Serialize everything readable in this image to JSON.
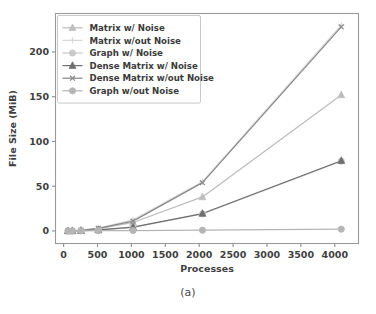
{
  "figure": {
    "caption": "(a)"
  },
  "chart_data": {
    "type": "line",
    "title": "",
    "xlabel": "Processes",
    "ylabel": "File Size (MiB)",
    "xlim": [
      -120,
      4350
    ],
    "ylim": [
      -14,
      243
    ],
    "xticks": [
      0,
      500,
      1000,
      1500,
      2000,
      2500,
      3000,
      3500,
      4000
    ],
    "xtick_labels": [
      "0",
      "500",
      "1000",
      "1500",
      "2000",
      "2500",
      "3000",
      "3500",
      "4000"
    ],
    "yticks": [
      0,
      50,
      100,
      150,
      200
    ],
    "ytick_labels": [
      "0",
      "50",
      "100",
      "150",
      "200"
    ],
    "grid": false,
    "legend_position": "upper left",
    "x": [
      64,
      128,
      256,
      512,
      1024,
      2048,
      4096
    ],
    "series": [
      {
        "name": "Matrix w/ Noise",
        "marker": "triangle",
        "color": "#bdbdbd",
        "values": [
          0.1,
          0.2,
          0.6,
          2.4,
          9.5,
          38.0,
          152.0
        ]
      },
      {
        "name": "Matrix w/out Noise",
        "marker": "plus",
        "color": "#d8d8d8",
        "values": [
          0.1,
          0.3,
          0.9,
          3.2,
          12.5,
          55.0,
          230.0
        ]
      },
      {
        "name": "Graph w/ Noise",
        "marker": "circle",
        "color": "#c9c9c9",
        "values": [
          0.05,
          0.1,
          0.3,
          1.0,
          4.0,
          19.0,
          78.0
        ]
      },
      {
        "name": "Dense Matrix w/ Noise",
        "marker": "triangle",
        "color": "#6f6f6f",
        "values": [
          0.05,
          0.1,
          0.3,
          1.1,
          4.3,
          19.5,
          78.5
        ]
      },
      {
        "name": "Dense Matrix w/out Noise",
        "marker": "x",
        "color": "#8a8a8a",
        "values": [
          0.1,
          0.2,
          0.7,
          2.8,
          11.0,
          54.0,
          228.0
        ]
      },
      {
        "name": "Graph w/out Noise",
        "marker": "circle",
        "color": "#b5b5b5",
        "values": [
          0.02,
          0.04,
          0.1,
          0.3,
          0.5,
          0.9,
          2.0
        ]
      }
    ]
  }
}
